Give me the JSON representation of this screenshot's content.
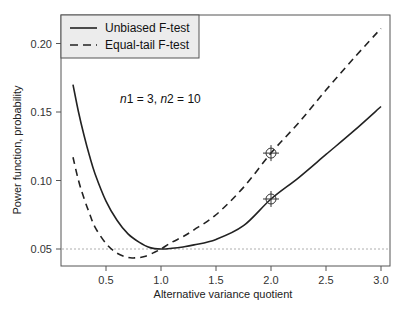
{
  "chart_data": {
    "type": "line",
    "title": "",
    "xlabel": "Alternative variance quotient",
    "ylabel": "Power function, probability",
    "xlim": [
      0.1,
      3.1
    ],
    "ylim": [
      0.035,
      0.22
    ],
    "x_ticks": [
      0.5,
      1.0,
      1.5,
      2.0,
      2.5,
      3.0
    ],
    "x_tick_labels": [
      "0.5",
      "1.0",
      "1.5",
      "2.0",
      "2.5",
      "3.0"
    ],
    "y_ticks": [
      0.05,
      0.1,
      0.15,
      0.2
    ],
    "y_tick_labels": [
      "0.05",
      "0.10",
      "0.15",
      "0.20"
    ],
    "grid": false,
    "legend_position": "top-left",
    "annotation": "n1 = 3, n2 = 10",
    "reference_line": {
      "y": 0.05,
      "style": "dotted",
      "color": "#999999"
    },
    "series": [
      {
        "name": "Unbiased F-test",
        "style": "solid",
        "color": "#222222",
        "x": [
          0.2,
          0.25,
          0.3,
          0.35,
          0.4,
          0.5,
          0.6,
          0.7,
          0.8,
          0.9,
          1.0,
          1.1,
          1.2,
          1.3,
          1.5,
          1.75,
          2.0,
          2.25,
          2.5,
          2.75,
          3.0
        ],
        "values": [
          0.17,
          0.15,
          0.133,
          0.118,
          0.105,
          0.085,
          0.071,
          0.061,
          0.055,
          0.051,
          0.05,
          0.0505,
          0.0515,
          0.053,
          0.057,
          0.067,
          0.0865,
          0.102,
          0.119,
          0.136,
          0.154
        ]
      },
      {
        "name": "Equal-tail F-test",
        "style": "dashed",
        "color": "#222222",
        "x": [
          0.2,
          0.25,
          0.3,
          0.35,
          0.4,
          0.5,
          0.6,
          0.7,
          0.76,
          0.85,
          0.95,
          1.0,
          1.1,
          1.2,
          1.3,
          1.5,
          1.75,
          2.0,
          2.25,
          2.5,
          2.75,
          3.0
        ],
        "values": [
          0.117,
          0.1,
          0.087,
          0.076,
          0.066,
          0.054,
          0.047,
          0.0438,
          0.0435,
          0.0445,
          0.048,
          0.05,
          0.055,
          0.059,
          0.064,
          0.075,
          0.095,
          0.12,
          0.142,
          0.166,
          0.189,
          0.211
        ]
      }
    ],
    "markers": [
      {
        "series": "Equal-tail F-test",
        "x": 2.0,
        "y": 0.12,
        "symbol": "circle-cross"
      },
      {
        "series": "Unbiased F-test",
        "x": 2.0,
        "y": 0.0865,
        "symbol": "circle-cross"
      }
    ]
  }
}
